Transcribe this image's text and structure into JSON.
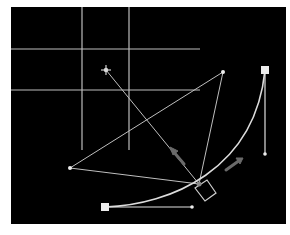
{
  "canvas": {
    "background": "#000000",
    "x": 11,
    "y": 7,
    "width": 275,
    "height": 217,
    "line_color": "#c8c8c8",
    "handle_color": "#e6e6e6",
    "arrow_color": "#6a6a6a"
  },
  "guides": {
    "horizontal": [
      {
        "y": 49,
        "x1": 11,
        "x2": 200
      },
      {
        "y": 90,
        "x1": 11,
        "x2": 200
      }
    ],
    "vertical": [
      {
        "x": 82,
        "y1": 7,
        "y2": 150
      },
      {
        "x": 129,
        "y1": 7,
        "y2": 150
      }
    ]
  },
  "curve": {
    "start_anchor": {
      "x": 105,
      "y": 207
    },
    "end_anchor": {
      "x": 265,
      "y": 70
    },
    "start_handle": {
      "x": 192,
      "y": 207
    },
    "end_handle": {
      "x": 265,
      "y": 154
    },
    "path": "M105,207 C170,205 255,170 265,70"
  },
  "construction": {
    "star_point": {
      "x": 106,
      "y": 70
    },
    "left_point": {
      "x": 70,
      "y": 168
    },
    "top_point": {
      "x": 223,
      "y": 72
    },
    "pivot": {
      "x": 199,
      "y": 184
    },
    "rotated_square": "195,188 207,180 216,193 205,201"
  },
  "arrows": [
    {
      "name": "left-direction-arrow",
      "x1": 172,
      "y1": 150,
      "x2": 184,
      "y2": 164
    },
    {
      "name": "right-direction-arrow",
      "x1": 240,
      "y1": 160,
      "x2": 226,
      "y2": 170
    }
  ]
}
